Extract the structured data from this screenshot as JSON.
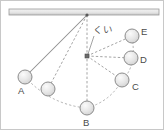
{
  "figure": {
    "ceiling": {
      "name": "ceiling-bar",
      "x": 8,
      "y": 8,
      "width": 150,
      "height": 6,
      "fill": "#e9e9e9",
      "stroke": "#9a9a9a"
    },
    "pivot": {
      "name": "pivot-point",
      "x": 86,
      "y": 14
    },
    "peg": {
      "label": "くい",
      "x": 86,
      "y": 55,
      "size": 4,
      "fill": "#6b6b6b",
      "label_x": 92,
      "label_y": 32
    },
    "colors": {
      "ball_fill": "#e4e4e4",
      "ball_stroke": "#8c8c8c",
      "string_solid": "#8d8d8d",
      "string_dashed": "#9a9a9a",
      "arc_dashed": "#a5a5a5",
      "label_text": "#4a4a4a",
      "background": "#ffffff",
      "border": "#c8c8c8"
    },
    "balls": [
      {
        "id": "A",
        "label": "A",
        "x": 24,
        "y": 76,
        "r": 7,
        "label_x": 17,
        "label_y": 93
      },
      {
        "id": "A2",
        "label": "",
        "x": 47,
        "y": 88,
        "r": 7,
        "label_x": 0,
        "label_y": 0
      },
      {
        "id": "B",
        "label": "B",
        "x": 86,
        "y": 107,
        "r": 7,
        "label_x": 82,
        "label_y": 125
      },
      {
        "id": "C",
        "label": "C",
        "x": 121,
        "y": 79,
        "r": 7,
        "label_x": 131,
        "label_y": 89
      },
      {
        "id": "D",
        "label": "D",
        "x": 130,
        "y": 57,
        "r": 7,
        "label_x": 139,
        "label_y": 62
      },
      {
        "id": "E",
        "label": "E",
        "x": 131,
        "y": 35,
        "r": 7,
        "label_x": 140,
        "label_y": 34
      }
    ],
    "strings": [
      {
        "name": "string-pivot-to-A",
        "from": "pivot",
        "to": "A",
        "style": "solid"
      },
      {
        "name": "string-pivot-to-A2",
        "from": "pivot",
        "to": "A2",
        "style": "dashed"
      },
      {
        "name": "string-pivot-to-B",
        "from": "pivot",
        "to": "B",
        "style": "dashed"
      },
      {
        "name": "string-peg-to-C",
        "from": "peg",
        "to": "C",
        "style": "dashed"
      },
      {
        "name": "string-peg-to-D",
        "from": "peg",
        "to": "D",
        "style": "dashed"
      },
      {
        "name": "string-peg-to-E",
        "from": "peg",
        "to": "E",
        "style": "dashed"
      }
    ],
    "arcs": [
      {
        "name": "arc-A-to-B",
        "path": "M 24 76 Q 50 104 86 107"
      },
      {
        "name": "arc-B-to-C",
        "path": "M 86 107 Q 110 100 121 79"
      },
      {
        "name": "arc-C-to-E",
        "path": "M 121 79 Q 136 66 131 35"
      }
    ]
  }
}
